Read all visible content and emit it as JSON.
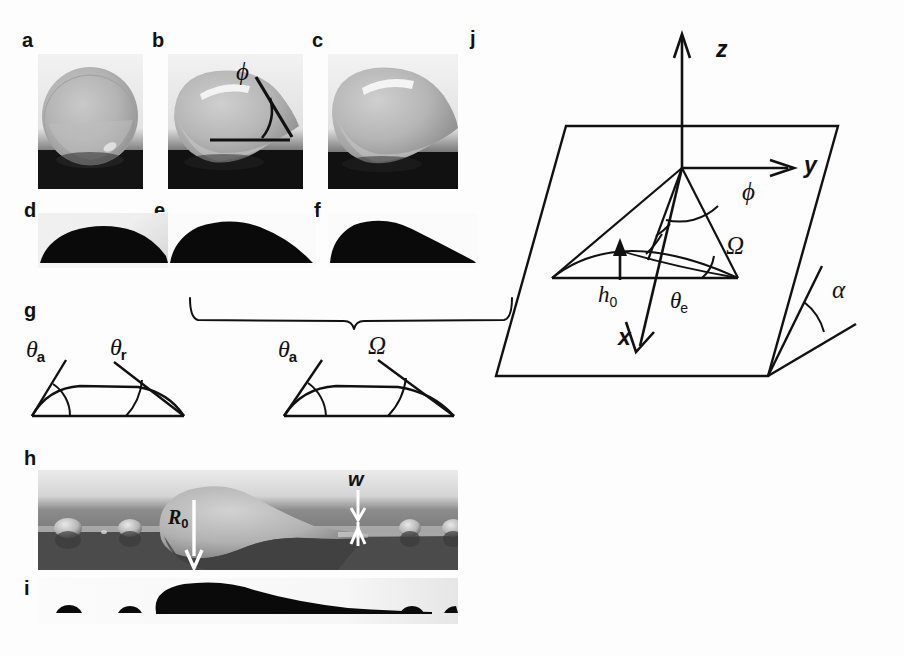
{
  "figure": {
    "background_color": "#fdfdfd",
    "ink_color": "#111111"
  },
  "panels": [
    {
      "id": "a",
      "label": "a",
      "type": "photograph",
      "x": 22,
      "y": 30,
      "caption": "Spherical drop, side view (low tilt)"
    },
    {
      "id": "b",
      "label": "b",
      "type": "photograph",
      "x": 152,
      "y": 30,
      "caption": "Drop with rear corner, angle phi marked"
    },
    {
      "id": "c",
      "label": "c",
      "type": "photograph",
      "x": 312,
      "y": 30,
      "caption": "Drop with sharp cusped tail"
    },
    {
      "id": "d",
      "label": "d",
      "type": "photograph",
      "x": 22,
      "y": 200,
      "caption": "Drop silhouette, symmetric"
    },
    {
      "id": "e",
      "label": "e",
      "type": "photograph",
      "x": 152,
      "y": 200,
      "caption": "Drop silhouette, asymmetric"
    },
    {
      "id": "f",
      "label": "f",
      "type": "photograph",
      "x": 312,
      "y": 200,
      "caption": "Drop silhouette, elongated tail"
    },
    {
      "id": "g",
      "label": "g",
      "type": "schematic",
      "x": 22,
      "y": 300,
      "caption": "Contact angle schematics"
    },
    {
      "id": "h",
      "label": "h",
      "type": "photograph",
      "x": 22,
      "y": 448,
      "caption": "Pearling drop leaving rivulet, R0 and w marked"
    },
    {
      "id": "i",
      "label": "i",
      "type": "photograph",
      "x": 22,
      "y": 578,
      "caption": "Silhouette of pearling drop"
    },
    {
      "id": "j",
      "label": "j",
      "type": "schematic",
      "x": 470,
      "y": 28,
      "caption": "3D coordinate schematic on inclined plane"
    }
  ],
  "labels": {
    "phi": "ϕ",
    "omega": "Ω",
    "alpha": "α",
    "theta_a": "θ",
    "theta_a_sub": "a",
    "theta_r": "θ",
    "theta_r_sub": "r",
    "theta_e": "θ",
    "theta_e_sub": "e",
    "h0": "h",
    "h0_sub": "0",
    "R0": "R",
    "R0_sub": "0",
    "w": "w",
    "axis_x": "x",
    "axis_y": "y",
    "axis_z": "z"
  },
  "panel_g": {
    "left_diagram": {
      "left_angle_label": "theta_a",
      "right_angle_label": "theta_r",
      "description": "Drop cross-section with advancing angle on left and receding angle on right"
    },
    "right_diagram": {
      "left_angle_label": "theta_a",
      "right_angle_label": "omega",
      "description": "Drop cross-section with advancing angle on left and corner angle Omega on right"
    },
    "bracket": {
      "x_start": 190,
      "x_end": 505,
      "tick_x": 352,
      "description": "Curly brace grouping panels e and f above the right schematic"
    }
  },
  "panel_j": {
    "plane_label": "inclined substrate plane",
    "axes": [
      "z",
      "y",
      "x"
    ],
    "angles": [
      "phi",
      "Omega",
      "theta_e",
      "alpha"
    ],
    "lengths": [
      "h0"
    ],
    "description": "Parallelogram representing the tilted plane, vertical z axis, horizontal y axis, x axis pointing down-forward, cone-like drop footprint with apex angles phi and Omega, equilibrium contact angle theta_e and inclination alpha"
  },
  "panel_h": {
    "annotations": [
      {
        "name": "R0",
        "kind": "arrow-down",
        "description": "Radius arrow pointing down into the drop"
      },
      {
        "name": "w",
        "kind": "double-arrow",
        "description": "Rivulet width marked by opposing arrowheads"
      }
    ]
  }
}
